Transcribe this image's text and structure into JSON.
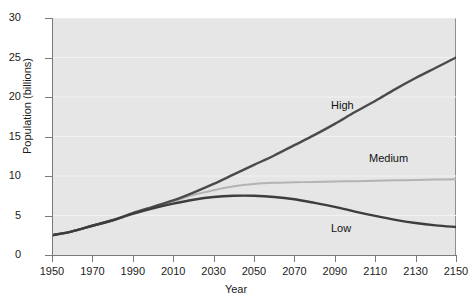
{
  "chart_data": {
    "type": "line",
    "title": "",
    "xlabel": "Year",
    "ylabel": "Population (billions)",
    "xlim": [
      1950,
      2150
    ],
    "ylim": [
      0,
      30
    ],
    "grid": "horizontal",
    "legend_position": "inline-annotations",
    "x_ticks": [
      1950,
      1970,
      1990,
      2010,
      2030,
      2050,
      2070,
      2090,
      2110,
      2130,
      2150
    ],
    "x_tick_labels": [
      "1950",
      "1970",
      "1990",
      "2010",
      "2030",
      "2050",
      "2070",
      "2090",
      "2110",
      "2130",
      "2150"
    ],
    "y_ticks": [
      0,
      5,
      10,
      15,
      20,
      25,
      30
    ],
    "y_tick_labels": [
      "0",
      "5",
      "10",
      "15",
      "20",
      "25",
      "30"
    ],
    "x": [
      1950,
      1960,
      1970,
      1980,
      1990,
      2000,
      2010,
      2020,
      2030,
      2040,
      2050,
      2060,
      2070,
      2080,
      2090,
      2100,
      2110,
      2120,
      2130,
      2140,
      2150
    ],
    "series": [
      {
        "name": "High",
        "label": "High",
        "color": "#4a4a4a",
        "linewidth": 2.4,
        "values": [
          2.5,
          3.0,
          3.7,
          4.4,
          5.3,
          6.1,
          6.9,
          7.9,
          9.0,
          10.2,
          11.4,
          12.6,
          13.9,
          15.2,
          16.6,
          18.1,
          19.5,
          21.0,
          22.4,
          23.7,
          25.0
        ]
      },
      {
        "name": "Medium",
        "label": "Medium",
        "color": "#b3b3b3",
        "linewidth": 2.0,
        "values": [
          2.5,
          3.0,
          3.7,
          4.4,
          5.3,
          6.1,
          6.8,
          7.6,
          8.2,
          8.7,
          9.0,
          9.15,
          9.2,
          9.25,
          9.3,
          9.35,
          9.4,
          9.45,
          9.5,
          9.55,
          9.6
        ]
      },
      {
        "name": "Low",
        "label": "Low",
        "color": "#3d3d3d",
        "linewidth": 2.4,
        "values": [
          2.5,
          3.0,
          3.7,
          4.4,
          5.2,
          5.9,
          6.5,
          7.0,
          7.35,
          7.5,
          7.5,
          7.35,
          7.05,
          6.6,
          6.1,
          5.5,
          4.95,
          4.45,
          4.05,
          3.75,
          3.55
        ]
      }
    ],
    "annotations": [
      {
        "text": "High",
        "x": 2085,
        "y": 14.5
      },
      {
        "text": "Medium",
        "x": 2110,
        "y": 11.0
      },
      {
        "text": "Low",
        "x": 2085,
        "y": 3.6
      }
    ],
    "plot_background": "#e6e6e6",
    "gridline_color": "#f2f2f2",
    "axis_color": "#7a7a7a",
    "text_color": "#1c1c1c"
  }
}
